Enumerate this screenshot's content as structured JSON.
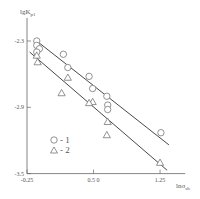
{
  "chart_data": {
    "type": "scatter",
    "title": "",
    "xlabel": "lnσsh",
    "xlabel_main": "lnσ",
    "xlabel_sub": "sh",
    "ylabel": "lgKp1",
    "ylabel_main": "lgK",
    "ylabel_sub": "p1",
    "xlim": [
      -0.25,
      1.5
    ],
    "ylim": [
      -3.5,
      -2.2
    ],
    "x_ticks": [
      -0.25,
      0.5,
      1.25
    ],
    "x_tick_labels": [
      "-0.25",
      "0.5 0",
      "1.25"
    ],
    "y_ticks": [
      -2.3,
      -2.9,
      -3.5
    ],
    "y_tick_labels": [
      "-2.3",
      "-2.9",
      "-3.5"
    ],
    "grid": false,
    "legend_position": "lower-left inside",
    "series": [
      {
        "name": "1",
        "marker": "circle",
        "points": [
          {
            "x": -0.14,
            "y": -2.3
          },
          {
            "x": -0.14,
            "y": -2.34
          },
          {
            "x": -0.11,
            "y": -2.37
          },
          {
            "x": -0.14,
            "y": -2.4
          },
          {
            "x": 0.16,
            "y": -2.42
          },
          {
            "x": 0.21,
            "y": -2.54
          },
          {
            "x": 0.45,
            "y": -2.62
          },
          {
            "x": 0.49,
            "y": -2.73
          },
          {
            "x": 0.65,
            "y": -2.8
          },
          {
            "x": 0.66,
            "y": -2.88
          },
          {
            "x": 0.66,
            "y": -2.92
          },
          {
            "x": 1.26,
            "y": -3.13
          }
        ],
        "fit_line": {
          "x1": -0.14,
          "y1": -2.3,
          "x2": 1.35,
          "y2": -3.24
        }
      },
      {
        "name": "2",
        "marker": "triangle",
        "points": [
          {
            "x": -0.14,
            "y": -2.43
          },
          {
            "x": -0.13,
            "y": -2.49
          },
          {
            "x": 0.21,
            "y": -2.63
          },
          {
            "x": 0.14,
            "y": -2.77
          },
          {
            "x": 0.49,
            "y": -2.85
          },
          {
            "x": 0.45,
            "y": -2.86
          },
          {
            "x": 0.66,
            "y": -3.03
          },
          {
            "x": 0.65,
            "y": -3.15
          },
          {
            "x": 1.25,
            "y": -3.4
          }
        ],
        "fit_line": {
          "x1": -0.22,
          "y1": -2.4,
          "x2": 1.33,
          "y2": -3.47
        }
      }
    ],
    "legend": [
      {
        "marker": "circle",
        "label": "○ - 1"
      },
      {
        "marker": "triangle",
        "label": "△ - 2"
      }
    ]
  },
  "plot_area": {
    "x_origin_px": 27,
    "x_scale_px_per_unit": 88.7,
    "y_origin_px": 41,
    "y_scale_px_per_unit": 110.5,
    "axis_color": "#666666",
    "marker_color": "#777777",
    "line_color": "#333333"
  }
}
